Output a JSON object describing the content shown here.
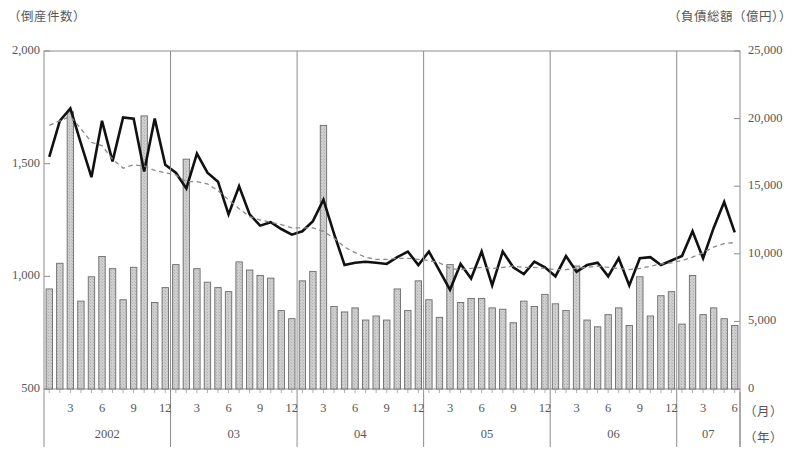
{
  "chart_data": {
    "type": "bar",
    "title": "",
    "subtitle": "",
    "xlabel_month": "（月）",
    "xlabel_year": "（年）",
    "left_axis": {
      "label": "（倒産件数）",
      "ticks": [
        "2,000",
        "1,500",
        "1,000",
        "500"
      ],
      "tick_values": [
        2000,
        1500,
        1000,
        500
      ],
      "ylim": [
        500,
        2000
      ]
    },
    "right_axis": {
      "label": "（負債総額（億円））",
      "ticks": [
        "25,000",
        "20,000",
        "15,000",
        "10,000",
        "5,000",
        "0"
      ],
      "tick_values": [
        25000,
        20000,
        15000,
        10000,
        5000,
        0
      ],
      "ylim": [
        0,
        25000
      ]
    },
    "grid": false,
    "legend_position": "none",
    "year_groups": [
      {
        "label": "2002",
        "months": 12
      },
      {
        "label": "03",
        "months": 12
      },
      {
        "label": "04",
        "months": 12
      },
      {
        "label": "05",
        "months": 12
      },
      {
        "label": "07",
        "months": 6
      }
    ],
    "year_groups_actual": [
      "2002",
      "03",
      "04",
      "05",
      "06",
      "07"
    ],
    "month_ticks": [
      3,
      6,
      9,
      12
    ],
    "x": [
      "2002/1",
      "2002/2",
      "2002/3",
      "2002/4",
      "2002/5",
      "2002/6",
      "2002/7",
      "2002/8",
      "2002/9",
      "2002/10",
      "2002/11",
      "2002/12",
      "03/1",
      "03/2",
      "03/3",
      "03/4",
      "03/5",
      "03/6",
      "03/7",
      "03/8",
      "03/9",
      "03/10",
      "03/11",
      "03/12",
      "04/1",
      "04/2",
      "04/3",
      "04/4",
      "04/5",
      "04/6",
      "04/7",
      "04/8",
      "04/9",
      "04/10",
      "04/11",
      "04/12",
      "05/1",
      "05/2",
      "05/3",
      "05/4",
      "05/5",
      "05/6",
      "05/7",
      "05/8",
      "05/9",
      "05/10",
      "05/11",
      "05/12",
      "06/1",
      "06/2",
      "06/3",
      "06/4",
      "06/5",
      "06/6",
      "06/7",
      "06/8",
      "06/9",
      "06/10",
      "06/11",
      "06/12",
      "07/1",
      "07/2",
      "07/3",
      "07/4",
      "07/5",
      "07/6"
    ],
    "series": [
      {
        "name": "負債総額（億円）",
        "type": "bar",
        "axis": "right",
        "fill": "#c9c9c9",
        "stroke": "#6b6b6b",
        "values": [
          7400,
          9300,
          20500,
          6500,
          8300,
          9800,
          8900,
          6600,
          9000,
          20200,
          6400,
          7500,
          9200,
          17000,
          8900,
          7900,
          7500,
          7200,
          9400,
          8800,
          8400,
          8200,
          5800,
          5200,
          8000,
          8700,
          19500,
          6100,
          5700,
          6000,
          5100,
          5400,
          5100,
          7400,
          5800,
          8000,
          6600,
          5300,
          9200,
          6400,
          6700,
          6700,
          6000,
          5900,
          4900,
          6500,
          6100,
          7000,
          6300,
          5800,
          9100,
          5100,
          4600,
          5500,
          6000,
          4700,
          8300,
          5400,
          6900,
          7200,
          4800,
          8400,
          5500,
          6000,
          5200,
          4700
        ]
      },
      {
        "name": "倒産件数",
        "type": "line",
        "style": "solid",
        "axis": "left",
        "color": "#111111",
        "values": [
          1530,
          1690,
          1745,
          1590,
          1440,
          1690,
          1510,
          1705,
          1700,
          1465,
          1700,
          1495,
          1460,
          1390,
          1545,
          1460,
          1420,
          1275,
          1400,
          1275,
          1225,
          1240,
          1210,
          1185,
          1200,
          1245,
          1340,
          1190,
          1050,
          1060,
          1065,
          1060,
          1055,
          1085,
          1110,
          1050,
          1110,
          1025,
          940,
          1055,
          990,
          1110,
          960,
          1110,
          1040,
          1010,
          1065,
          1040,
          1000,
          1090,
          1020,
          1050,
          1060,
          1000,
          1080,
          960,
          1080,
          1085,
          1050,
          1070,
          1090,
          1200,
          1080,
          1215,
          1330,
          1195
        ]
      },
      {
        "name": "倒産件数（移動平均）",
        "type": "line",
        "style": "dashed",
        "axis": "left",
        "color": "#8a8a8a",
        "values": [
          1670,
          1690,
          1710,
          1655,
          1595,
          1580,
          1520,
          1480,
          1495,
          1490,
          1470,
          1460,
          1450,
          1420,
          1420,
          1410,
          1380,
          1340,
          1300,
          1265,
          1250,
          1240,
          1230,
          1215,
          1215,
          1215,
          1200,
          1170,
          1130,
          1105,
          1085,
          1075,
          1075,
          1080,
          1080,
          1075,
          1070,
          1060,
          1035,
          1030,
          1035,
          1040,
          1035,
          1040,
          1045,
          1040,
          1040,
          1035,
          1030,
          1030,
          1035,
          1040,
          1045,
          1040,
          1035,
          1030,
          1035,
          1045,
          1055,
          1060,
          1070,
          1085,
          1105,
          1130,
          1145,
          1150
        ]
      }
    ]
  }
}
